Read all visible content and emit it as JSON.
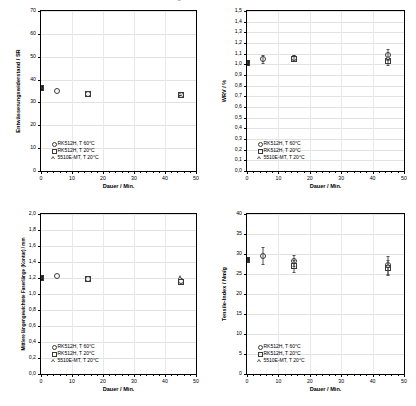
{
  "figure": {
    "clipped_header": "Abbildung",
    "legend_entries": [
      {
        "symbol": "circle",
        "label": "RK512H, T 60°C"
      },
      {
        "symbol": "square",
        "label": "RK512H, T 20°C"
      },
      {
        "symbol": "triangle",
        "label": "5510E-MT, T 20°C"
      }
    ]
  },
  "chart_data": [
    {
      "type": "scatter",
      "panel": "top-left",
      "title": "",
      "xlabel": "Dauer / Min.",
      "ylabel": "Entwässerungswiderstand / SR",
      "xlim": [
        0,
        50
      ],
      "ylim": [
        0,
        70
      ],
      "xticks": [
        0,
        10,
        20,
        30,
        40,
        50
      ],
      "yticks": [
        0,
        10,
        20,
        30,
        40,
        50,
        60,
        70
      ],
      "xticklabels": [
        "0",
        "10",
        "20",
        "30",
        "40",
        "50"
      ],
      "yticklabels": [
        "0",
        "10",
        "20",
        "30",
        "40",
        "50",
        "60",
        "70"
      ],
      "grid": true,
      "legend_position": "lower left",
      "series": [
        {
          "name": "RK512H, T 60°C",
          "symbol": "circle",
          "points": [
            {
              "x": 0,
              "y": 36.5
            },
            {
              "x": 5,
              "y": 34.8
            },
            {
              "x": 15,
              "y": 33.6
            },
            {
              "x": 45,
              "y": 33.4
            }
          ]
        },
        {
          "name": "RK512H, T 20°C",
          "symbol": "square",
          "points": [
            {
              "x": 0,
              "y": 36.5
            },
            {
              "x": 15,
              "y": 33.6
            },
            {
              "x": 45,
              "y": 33.2
            }
          ]
        },
        {
          "name": "5510E-MT, T 20°C",
          "symbol": "triangle",
          "points": [
            {
              "x": 0,
              "y": 36.6
            },
            {
              "x": 45,
              "y": 33.8
            }
          ]
        }
      ]
    },
    {
      "type": "scatter",
      "panel": "top-right",
      "title": "",
      "xlabel": "Dauer / Min.",
      "ylabel": "WRV / %",
      "xlim": [
        0,
        50
      ],
      "ylim": [
        0.0,
        1.5
      ],
      "xticks": [
        0,
        10,
        20,
        30,
        40,
        50
      ],
      "yticks": [
        0.0,
        0.1,
        0.2,
        0.3,
        0.4,
        0.5,
        0.6,
        0.7,
        0.8,
        0.9,
        1.0,
        1.1,
        1.2,
        1.3,
        1.4,
        1.5
      ],
      "xticklabels": [
        "0",
        "10",
        "20",
        "30",
        "40",
        "50"
      ],
      "yticklabels": [
        "0,0",
        "0,1",
        "0,2",
        "0,3",
        "0,4",
        "0,5",
        "0,6",
        "0,7",
        "0,8",
        "0,9",
        "1,0",
        "1,1",
        "1,2",
        "1,3",
        "1,4",
        "1,5"
      ],
      "grid": true,
      "legend_position": "lower left",
      "series": [
        {
          "name": "RK512H, T 60°C",
          "symbol": "circle",
          "points": [
            {
              "x": 0,
              "y": 1.01
            },
            {
              "x": 5,
              "y": 1.05,
              "yerr": 0.04
            },
            {
              "x": 15,
              "y": 1.06,
              "yerr": 0.03
            },
            {
              "x": 45,
              "y": 1.09,
              "yerr": 0.05
            }
          ]
        },
        {
          "name": "RK512H, T 20°C",
          "symbol": "square",
          "points": [
            {
              "x": 0,
              "y": 1.01
            },
            {
              "x": 15,
              "y": 1.05
            },
            {
              "x": 45,
              "y": 1.03,
              "yerr": 0.04
            }
          ]
        },
        {
          "name": "5510E-MT, T 20°C",
          "symbol": "triangle",
          "points": [
            {
              "x": 0,
              "y": 1.02
            },
            {
              "x": 45,
              "y": 1.06
            }
          ]
        }
      ]
    },
    {
      "type": "scatter",
      "panel": "bottom-left",
      "title": "",
      "xlabel": "Dauer / Min.",
      "ylabel": "Mittlere längengewichtete Faserlänge (Kontur) / mm",
      "xlim": [
        0,
        50
      ],
      "ylim": [
        0.0,
        2.0
      ],
      "xticks": [
        0,
        10,
        20,
        30,
        40,
        50
      ],
      "yticks": [
        0.0,
        0.2,
        0.4,
        0.6,
        0.8,
        1.0,
        1.2,
        1.4,
        1.6,
        1.8,
        2.0
      ],
      "xticklabels": [
        "0",
        "10",
        "20",
        "30",
        "40",
        "50"
      ],
      "yticklabels": [
        "0,0",
        "0,2",
        "0,4",
        "0,6",
        "0,8",
        "1,0",
        "1,2",
        "1,4",
        "1,6",
        "1,8",
        "2,0"
      ],
      "grid": true,
      "legend_position": "lower left",
      "series": [
        {
          "name": "RK512H, T 60°C",
          "symbol": "circle",
          "points": [
            {
              "x": 0,
              "y": 1.2
            },
            {
              "x": 5,
              "y": 1.23
            },
            {
              "x": 15,
              "y": 1.19
            },
            {
              "x": 45,
              "y": 1.16
            }
          ]
        },
        {
          "name": "RK512H, T 20°C",
          "symbol": "square",
          "points": [
            {
              "x": 0,
              "y": 1.2
            },
            {
              "x": 15,
              "y": 1.19
            },
            {
              "x": 45,
              "y": 1.15
            }
          ]
        },
        {
          "name": "5510E-MT, T 20°C",
          "symbol": "triangle",
          "points": [
            {
              "x": 0,
              "y": 1.21
            },
            {
              "x": 45,
              "y": 1.21
            }
          ]
        }
      ]
    },
    {
      "type": "scatter",
      "panel": "bottom-right",
      "title": "",
      "xlabel": "Dauer / Min.",
      "ylabel": "Tensile-Index / Nm/g",
      "xlim": [
        0,
        50
      ],
      "ylim": [
        0,
        40
      ],
      "xticks": [
        0,
        10,
        20,
        30,
        40,
        50
      ],
      "yticks": [
        0,
        5,
        10,
        15,
        20,
        25,
        30,
        35,
        40
      ],
      "xticklabels": [
        "0",
        "10",
        "20",
        "30",
        "40",
        "50"
      ],
      "yticklabels": [
        "0",
        "5",
        "10",
        "15",
        "20",
        "25",
        "30",
        "35",
        "40"
      ],
      "grid": true,
      "legend_position": "lower left",
      "series": [
        {
          "name": "RK512H, T 60°C",
          "symbol": "circle",
          "points": [
            {
              "x": 0,
              "y": 28.5
            },
            {
              "x": 5,
              "y": 29.6,
              "yerr": 2.2
            },
            {
              "x": 15,
              "y": 28.3,
              "yerr": 1.4
            },
            {
              "x": 45,
              "y": 27.3,
              "yerr": 2.3
            }
          ]
        },
        {
          "name": "RK512H, T 20°C",
          "symbol": "square",
          "points": [
            {
              "x": 0,
              "y": 28.4
            },
            {
              "x": 15,
              "y": 26.9,
              "yerr": 1.5
            },
            {
              "x": 45,
              "y": 26.6,
              "yerr": 1.8
            }
          ]
        },
        {
          "name": "5510E-MT, T 20°C",
          "symbol": "triangle",
          "points": [
            {
              "x": 0,
              "y": 28.6
            },
            {
              "x": 45,
              "y": 27.0
            }
          ]
        }
      ]
    }
  ]
}
